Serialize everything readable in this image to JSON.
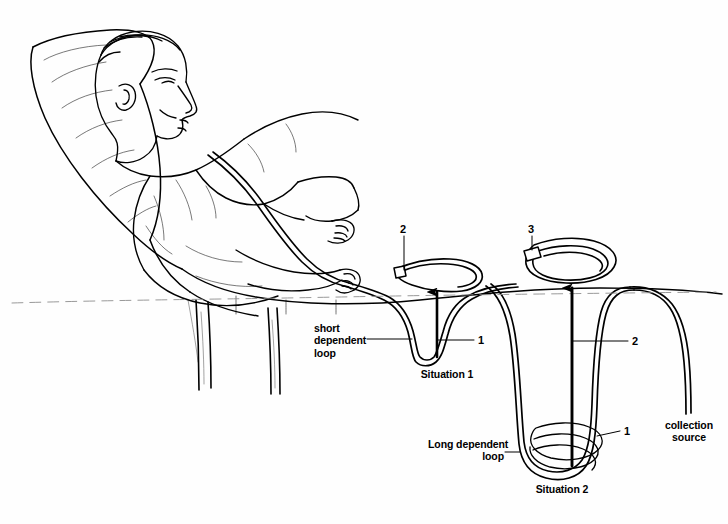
{
  "figure": {
    "background_color": "#fefefe",
    "ink_color": "#000000",
    "width": 728,
    "height": 524
  },
  "scene": {
    "patient": "reclining man in a lounge chair with chest drainage tubing",
    "chair": "reclining lounge chair with cushion and legs",
    "reference_line": "dashed horizontal fluid-level reference line"
  },
  "annotations": {
    "short_loop_label": "short\ndependent\nloop",
    "long_loop_label": "Long dependent\nloop",
    "collection_source_label": "collection\nsource"
  },
  "captions": {
    "situation_1": "Situation 1",
    "situation_2": "Situation 2"
  },
  "callouts": {
    "short_loop_number": "1",
    "connector_top_left_number": "2",
    "connector_top_right_number": "3",
    "long_loop_upper_number": "2",
    "long_loop_lower_number": "1"
  },
  "arrows": {
    "situation_1_arrow": "upward pressure arrow in short dependent loop",
    "situation_2_arrow": "upward pressure arrow in long dependent loop"
  }
}
